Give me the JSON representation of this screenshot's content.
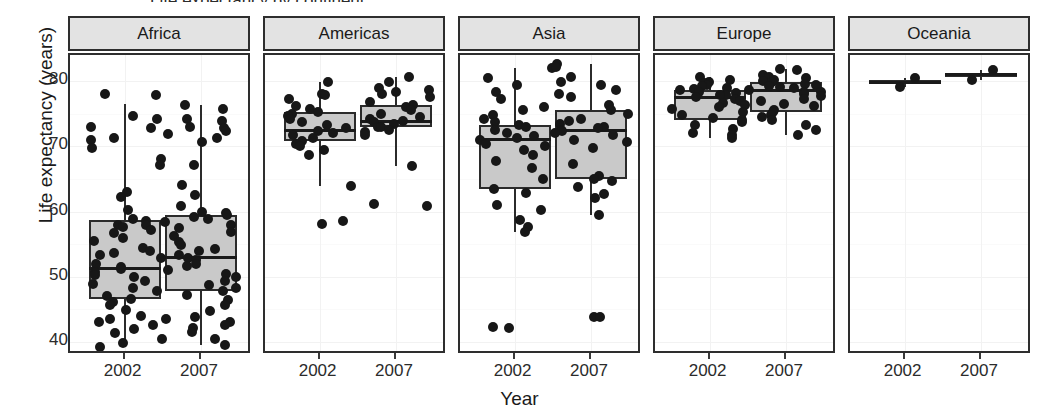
{
  "chart_data": {
    "type": "box",
    "title": "Life expectancy by continent",
    "xlabel": "Year",
    "ylabel": "Life expectancy (years)",
    "ylim": [
      38,
      84
    ],
    "yticks": [
      40,
      50,
      60,
      70,
      80
    ],
    "ytick_labels": [
      "40",
      "50",
      "60",
      "70",
      "80"
    ],
    "grid": true,
    "legend": "none",
    "facet_variable": "continent",
    "facet_labels": [
      "Africa",
      "Americas",
      "Asia",
      "Europe",
      "Oceania"
    ],
    "categories": [
      "2002",
      "2007"
    ],
    "panels": [
      {
        "label": "Africa",
        "groups": [
          {
            "year": "2002",
            "n": 52,
            "min": 39.2,
            "q1": 46.6,
            "median": 51.2,
            "q3": 58.7,
            "max": 78.0,
            "whisker_low": 39.2,
            "whisker_high": 76.5,
            "points": [
              78.0,
              77.8,
              74.7,
              74.2,
              73.0,
              72.8,
              71.3,
              71.0,
              69.8,
              68.1,
              67.1,
              63.0,
              62.2,
              60.3,
              58.8,
              58.5,
              58.0,
              57.9,
              57.6,
              57.2,
              56.7,
              56.0,
              55.5,
              54.4,
              54.0,
              53.7,
              53.3,
              52.9,
              52.0,
              51.5,
              51.2,
              50.7,
              50.3,
              49.9,
              49.3,
              48.9,
              48.3,
              47.8,
              47.0,
              46.6,
              46.2,
              45.6,
              44.9,
              44.0,
              43.5,
              43.0,
              42.6,
              42.0,
              41.3,
              40.5,
              39.9,
              39.2
            ]
          },
          {
            "year": "2007",
            "n": 52,
            "min": 39.6,
            "q1": 47.8,
            "median": 52.9,
            "q3": 59.4,
            "max": 76.4,
            "whisker_low": 39.6,
            "whisker_high": 76.4,
            "points": [
              76.4,
              75.7,
              74.2,
              73.9,
              73.0,
              72.8,
              72.3,
              71.9,
              71.3,
              70.6,
              67.2,
              64.0,
              62.5,
              60.9,
              60.0,
              59.8,
              59.5,
              59.2,
              58.9,
              58.4,
              58.0,
              57.5,
              56.9,
              56.2,
              55.3,
              54.8,
              54.2,
              53.9,
              53.3,
              52.9,
              52.5,
              52.0,
              51.6,
              51.0,
              50.4,
              49.9,
              49.3,
              48.8,
              48.3,
              47.8,
              47.2,
              46.5,
              45.7,
              44.7,
              43.9,
              43.5,
              43.0,
              42.6,
              42.1,
              41.6,
              40.4,
              39.6
            ]
          }
        ]
      },
      {
        "label": "Americas",
        "groups": [
          {
            "year": "2002",
            "n": 25,
            "min": 58.1,
            "q1": 70.8,
            "median": 72.4,
            "q3": 75.3,
            "max": 79.8,
            "whisker_low": 63.9,
            "whisker_high": 79.8,
            "points": [
              79.8,
              78.0,
              77.9,
              77.2,
              76.2,
              75.7,
              75.3,
              74.9,
              74.6,
              74.2,
              73.8,
              73.2,
              72.8,
              72.4,
              72.0,
              71.7,
              71.3,
              70.8,
              70.3,
              70.0,
              69.4,
              68.6,
              63.9,
              58.5,
              58.1
            ]
          },
          {
            "year": "2007",
            "n": 25,
            "min": 60.9,
            "q1": 72.9,
            "median": 73.8,
            "q3": 76.4,
            "max": 80.7,
            "whisker_low": 67.0,
            "whisker_high": 80.7,
            "points": [
              80.7,
              79.8,
              79.0,
              78.6,
              78.3,
              78.0,
              77.6,
              76.8,
              76.4,
              76.0,
              75.6,
              75.0,
              74.5,
              74.2,
              73.9,
              73.8,
              73.4,
              73.0,
              72.9,
              72.5,
              72.2,
              71.8,
              67.0,
              61.2,
              60.9
            ]
          }
        ]
      },
      {
        "label": "Asia",
        "groups": [
          {
            "year": "2002",
            "n": 33,
            "min": 42.1,
            "q1": 63.4,
            "median": 71.0,
            "q3": 73.3,
            "max": 82.0,
            "whisker_low": 56.8,
            "whisker_high": 82.0,
            "points": [
              82.0,
              80.4,
              79.4,
              78.3,
              77.3,
              76.1,
              75.6,
              74.8,
              74.2,
              73.8,
              73.3,
              72.9,
              72.5,
              72.0,
              71.6,
              71.3,
              71.0,
              70.4,
              70.0,
              69.5,
              68.6,
              67.8,
              66.7,
              65.0,
              63.4,
              62.9,
              61.0,
              60.3,
              58.7,
              57.6,
              56.8,
              42.3,
              42.1
            ]
          },
          {
            "year": "2007",
            "n": 33,
            "min": 43.8,
            "q1": 65.0,
            "median": 72.4,
            "q3": 75.6,
            "max": 82.6,
            "whisker_low": 59.5,
            "whisker_high": 82.6,
            "points": [
              82.6,
              82.2,
              80.7,
              79.9,
              79.4,
              78.6,
              78.0,
              77.6,
              76.4,
              75.6,
              75.0,
              74.2,
              73.9,
              73.4,
              73.0,
              72.8,
              72.5,
              72.4,
              72.0,
              71.7,
              71.0,
              70.6,
              69.8,
              67.3,
              65.5,
              65.0,
              64.7,
              63.8,
              62.7,
              62.1,
              59.5,
              43.9,
              43.8
            ]
          }
        ]
      },
      {
        "label": "Europe",
        "groups": [
          {
            "year": "2002",
            "n": 30,
            "min": 71.3,
            "q1": 74.1,
            "median": 77.5,
            "q3": 78.6,
            "max": 80.6,
            "whisker_low": 71.3,
            "whisker_high": 80.6,
            "points": [
              80.6,
              80.2,
              79.9,
              79.7,
              79.4,
              79.2,
              79.0,
              78.8,
              78.6,
              78.3,
              78.1,
              77.9,
              77.8,
              77.5,
              77.3,
              77.0,
              76.7,
              76.4,
              76.1,
              75.7,
              75.2,
              74.8,
              74.4,
              74.1,
              73.7,
              73.2,
              72.6,
              72.1,
              71.7,
              71.3
            ]
          },
          {
            "year": "2007",
            "n": 30,
            "min": 71.8,
            "q1": 75.3,
            "median": 78.6,
            "q3": 79.8,
            "max": 81.8,
            "whisker_low": 71.8,
            "whisker_high": 81.8,
            "points": [
              81.8,
              81.7,
              80.9,
              80.7,
              80.5,
              80.2,
              80.0,
              79.8,
              79.6,
              79.4,
              79.3,
              79.1,
              78.9,
              78.6,
              78.4,
              78.3,
              78.0,
              77.7,
              77.3,
              76.9,
              76.5,
              76.2,
              75.6,
              75.3,
              74.8,
              74.5,
              74.0,
              73.3,
              72.5,
              71.8
            ]
          }
        ]
      },
      {
        "label": "Oceania",
        "groups": [
          {
            "year": "2002",
            "n": 2,
            "min": 79.1,
            "q1": 79.5,
            "median": 79.8,
            "q3": 80.1,
            "max": 80.4,
            "whisker_low": 79.1,
            "whisker_high": 80.4,
            "points": [
              80.4,
              79.1
            ]
          },
          {
            "year": "2007",
            "n": 2,
            "min": 80.2,
            "q1": 80.6,
            "median": 81.0,
            "q3": 81.3,
            "max": 81.7,
            "whisker_low": 80.2,
            "whisker_high": 81.7,
            "points": [
              81.7,
              80.2
            ]
          }
        ]
      }
    ]
  },
  "style": {
    "box_fill": "#c9c9c9",
    "box_border": "#2b2b2b",
    "point_color": "#171717",
    "strip_fill": "#e3e3e3",
    "panel_border": "#2e2e2e",
    "background": "#ffffff"
  }
}
